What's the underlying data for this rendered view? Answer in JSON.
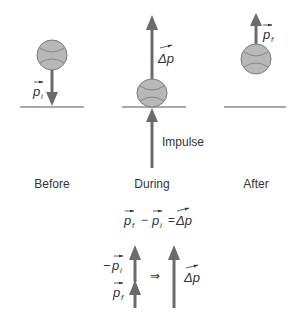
{
  "diagram": {
    "colors": {
      "arrow": "#6b6b6b",
      "ball_fill": "#b8b8b8",
      "ball_stroke": "#7a7a7a",
      "ground": "#555555",
      "text": "#333333"
    },
    "panels": [
      {
        "id": "before",
        "caption": "Before",
        "vector": {
          "symbol": "p",
          "subscript": "i",
          "direction": "down"
        }
      },
      {
        "id": "during",
        "caption": "During",
        "vector": {
          "symbol": "Δp",
          "direction": "up"
        },
        "force_label": "Impulse"
      },
      {
        "id": "after",
        "caption": "After",
        "vector": {
          "symbol": "p",
          "subscript": "f",
          "direction": "up"
        }
      }
    ],
    "equation": {
      "term1": {
        "symbol": "p",
        "subscript": "f"
      },
      "operator1": "−",
      "term2": {
        "symbol": "p",
        "subscript": "i"
      },
      "operator2": "=",
      "result": {
        "symbol": "Δp"
      }
    },
    "vector_sum": {
      "upper": {
        "prefix": "−",
        "symbol": "p",
        "subscript": "i"
      },
      "lower": {
        "symbol": "p",
        "subscript": "f"
      },
      "implies": "⇒",
      "result": {
        "symbol": "Δp"
      }
    }
  }
}
